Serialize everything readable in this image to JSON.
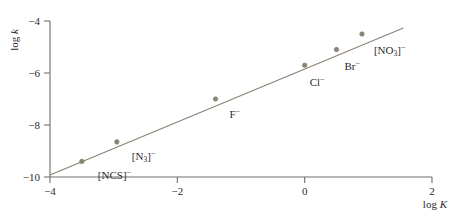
{
  "chart_data": {
    "type": "scatter",
    "title": "",
    "subtitle": "",
    "xlabel": "log K",
    "ylabel": "log k",
    "xlim": [
      -4,
      2
    ],
    "ylim": [
      -10,
      -4
    ],
    "grid": false,
    "legend": "none",
    "xticks": [
      "-4",
      "-2",
      "0",
      "2"
    ],
    "xtick_values": [
      -4,
      -2,
      0,
      2
    ],
    "yticks": [
      "-4",
      "-6",
      "-8",
      "-10"
    ],
    "ytick_values": [
      -4,
      -6,
      -8,
      -10
    ],
    "x": [
      -3.5,
      -2.95,
      -1.4,
      0.0,
      0.5,
      0.9
    ],
    "y": [
      -9.4,
      -8.65,
      -7.0,
      -5.7,
      -5.1,
      -4.5
    ],
    "point_labels": [
      "[NCS]-",
      "[N3]-",
      "F-",
      "Cl-",
      "Br-",
      "[NO3]-"
    ],
    "points": [
      {
        "name": "thiocyanate",
        "label_html": "[NCS]<sup>−</sup>",
        "x": -3.5,
        "y": -9.4,
        "label_dx": 16,
        "label_dy": 9
      },
      {
        "name": "azide",
        "label_html": "[N<sub>3</sub>]<sup>−</sup>",
        "x": -2.95,
        "y": -8.65,
        "label_dx": 15,
        "label_dy": 9
      },
      {
        "name": "fluoride",
        "label_html": "F<sup>−</sup>",
        "x": -1.4,
        "y": -7.0,
        "label_dx": 14,
        "label_dy": 10
      },
      {
        "name": "chloride",
        "label_html": "Cl<sup>−</sup>",
        "x": 0.0,
        "y": -5.7,
        "label_dx": 5,
        "label_dy": 12
      },
      {
        "name": "bromide",
        "label_html": "Br<sup>−</sup>",
        "x": 0.5,
        "y": -5.1,
        "label_dx": 8,
        "label_dy": 11
      },
      {
        "name": "nitrate",
        "label_html": "[NO<sub>3</sub>]<sup>−</sup>",
        "x": 0.9,
        "y": -4.5,
        "label_dx": 12,
        "label_dy": 11
      }
    ],
    "fit_line": {
      "name": "linear-fit",
      "x_start": -4.0,
      "y_start": -9.92,
      "x_end": 1.55,
      "y_end": -4.27,
      "slope": 1.018,
      "intercept": -5.85
    },
    "marker_color": "#8a8374",
    "line_color": "#8a8374",
    "axis_color": "#6e6e6e",
    "text_color": "#2b2b2b"
  }
}
